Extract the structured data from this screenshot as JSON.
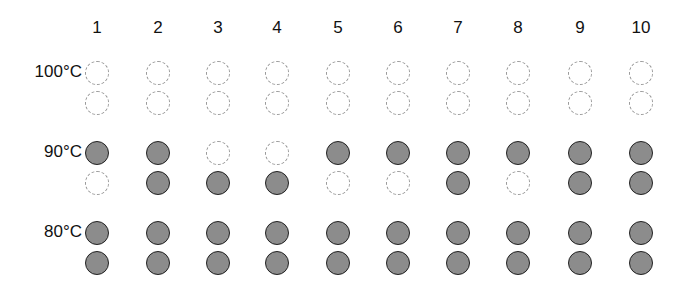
{
  "columns": [
    "1",
    "2",
    "3",
    "4",
    "5",
    "6",
    "7",
    "8",
    "9",
    "10"
  ],
  "column_x": [
    97,
    158,
    218,
    277,
    338,
    398,
    458,
    518,
    580,
    641
  ],
  "groups": [
    {
      "label": "100°C",
      "label_y": 62,
      "rows": [
        {
          "y": 73,
          "states": [
            0,
            0,
            0,
            0,
            0,
            0,
            0,
            0,
            0,
            0
          ]
        },
        {
          "y": 103,
          "states": [
            0,
            0,
            0,
            0,
            0,
            0,
            0,
            0,
            0,
            0
          ]
        }
      ]
    },
    {
      "label": "90°C",
      "label_y": 142,
      "rows": [
        {
          "y": 153,
          "states": [
            1,
            1,
            0,
            0,
            1,
            1,
            1,
            1,
            1,
            1
          ]
        },
        {
          "y": 183,
          "states": [
            0,
            1,
            1,
            1,
            0,
            0,
            1,
            0,
            1,
            1
          ]
        }
      ]
    },
    {
      "label": "80°C",
      "label_y": 222,
      "rows": [
        {
          "y": 233,
          "states": [
            1,
            1,
            1,
            1,
            1,
            1,
            1,
            1,
            1,
            1
          ]
        },
        {
          "y": 263,
          "states": [
            1,
            1,
            1,
            1,
            1,
            1,
            1,
            1,
            1,
            1
          ]
        }
      ]
    }
  ],
  "legend": {
    "filled": "filled circle (present)",
    "empty": "dashed empty circle (absent)"
  },
  "colors": {
    "fill": "#8c8c8c",
    "stroke": "#222222",
    "dashed": "#9a9a9a"
  }
}
